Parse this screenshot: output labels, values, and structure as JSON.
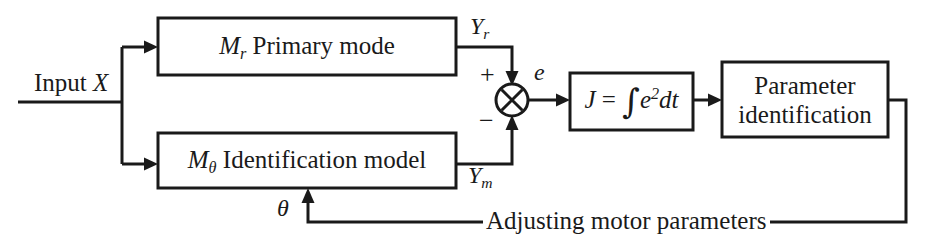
{
  "diagram": {
    "background_color": "#ffffff",
    "line_color": "#1a1a1a",
    "input": {
      "label_text": "Input ",
      "label_var": "X"
    },
    "blocks": [
      {
        "id": "primary-mode",
        "var": "M",
        "var_sub": "r",
        "text": " Primary mode"
      },
      {
        "id": "identification-model",
        "var": "M",
        "var_sub": "θ",
        "text": " Identification model"
      },
      {
        "id": "cost-function",
        "lhs": "J",
        "eq": " = ",
        "integral": "∫",
        "integrand_var": "e",
        "integrand_sup": "2",
        "differential": "dt"
      },
      {
        "id": "parameter-identification",
        "line1": "Parameter",
        "line2": "identification"
      }
    ],
    "signals": {
      "y_r": "Y",
      "y_r_sub": "r",
      "y_m": "Y",
      "y_m_sub": "m",
      "error": "e",
      "theta": "θ",
      "plus": "+",
      "minus": "−"
    },
    "feedback": {
      "label": "Adjusting motor parameters"
    },
    "summing_junction": {
      "id": "summing-junction",
      "style": "crossed-circle"
    }
  }
}
